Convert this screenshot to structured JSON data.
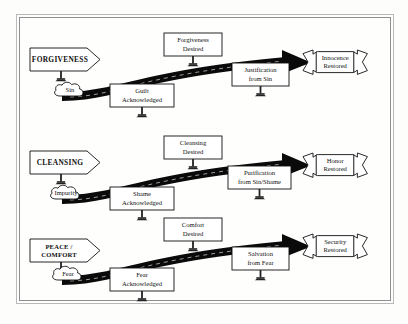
{
  "figure": {
    "title": "",
    "background_color": "#fdfdfc",
    "ink_color": "#111111",
    "road_color": "#0a0a0a"
  },
  "rows": [
    {
      "id": "forgiveness",
      "entry_sign": "FORGIVENESS",
      "entry_sign_lines": [
        "FORGIVENESS"
      ],
      "cloud": "Sin",
      "sign_lower_left_lines": [
        "Guilt",
        "Acknowledged"
      ],
      "sign_upper_mid_lines": [
        "Forgiveness",
        "Desired"
      ],
      "sign_lower_right_lines": [
        "Justification",
        "from Sin"
      ],
      "banner_lines": [
        "Innocence",
        "Restored"
      ]
    },
    {
      "id": "cleansing",
      "entry_sign": "CLEANSING",
      "entry_sign_lines": [
        "CLEANSING"
      ],
      "cloud": "Impurity",
      "sign_lower_left_lines": [
        "Shame",
        "Acknowledged"
      ],
      "sign_upper_mid_lines": [
        "Cleansing",
        "Desired"
      ],
      "sign_lower_right_lines": [
        "Purification",
        "from Sin/Shame"
      ],
      "banner_lines": [
        "Honor",
        "Restored"
      ]
    },
    {
      "id": "peace-comfort",
      "entry_sign": "PEACE / COMFORT",
      "entry_sign_lines": [
        "PEACE /",
        "COMFORT"
      ],
      "cloud": "Fear",
      "sign_lower_left_lines": [
        "Fear",
        "Acknowledged"
      ],
      "sign_upper_mid_lines": [
        "Comfort",
        "Desired"
      ],
      "sign_lower_right_lines": [
        "Salvation",
        "from Fear"
      ],
      "banner_lines": [
        "Security",
        "Restored"
      ]
    }
  ],
  "icons": {
    "entry_arrow_sign": "arrow-sign-icon",
    "cloud": "cloud-icon",
    "road": "road-arrow-icon",
    "banner": "ribbon-banner-icon",
    "post": "sign-post-icon"
  }
}
